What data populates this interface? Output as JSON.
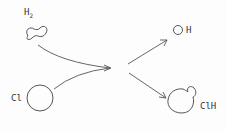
{
  "diagram": {
    "type": "reaction-scheme",
    "reactants": [
      {
        "id": "h2",
        "label": "H",
        "subscript": "2",
        "shape": "dumbbell"
      },
      {
        "id": "cl",
        "label": "Cl",
        "shape": "circle"
      }
    ],
    "products": [
      {
        "id": "h",
        "label": "H",
        "shape": "small-circle"
      },
      {
        "id": "clh",
        "label": "ClH",
        "shape": "circle-with-bump"
      }
    ],
    "colors": {
      "stroke": "#555555",
      "text": "#333333",
      "background": "#fdfdfd"
    }
  }
}
